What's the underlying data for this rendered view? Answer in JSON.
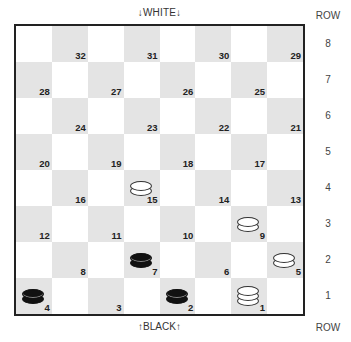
{
  "labels": {
    "top": "↓WHITE↓",
    "bottom": "↑BLACK↑",
    "row_header_top": "ROW",
    "row_header_bottom": "ROW"
  },
  "rows": [
    "8",
    "7",
    "6",
    "5",
    "4",
    "3",
    "2",
    "1"
  ],
  "squares": [
    {
      "num": "32",
      "row": 8,
      "col": 2
    },
    {
      "num": "31",
      "row": 8,
      "col": 4
    },
    {
      "num": "30",
      "row": 8,
      "col": 6
    },
    {
      "num": "29",
      "row": 8,
      "col": 8
    },
    {
      "num": "28",
      "row": 7,
      "col": 1
    },
    {
      "num": "27",
      "row": 7,
      "col": 3
    },
    {
      "num": "26",
      "row": 7,
      "col": 5
    },
    {
      "num": "25",
      "row": 7,
      "col": 7
    },
    {
      "num": "24",
      "row": 6,
      "col": 2
    },
    {
      "num": "23",
      "row": 6,
      "col": 4
    },
    {
      "num": "22",
      "row": 6,
      "col": 6
    },
    {
      "num": "21",
      "row": 6,
      "col": 8
    },
    {
      "num": "20",
      "row": 5,
      "col": 1
    },
    {
      "num": "19",
      "row": 5,
      "col": 3
    },
    {
      "num": "18",
      "row": 5,
      "col": 5
    },
    {
      "num": "17",
      "row": 5,
      "col": 7
    },
    {
      "num": "16",
      "row": 4,
      "col": 2
    },
    {
      "num": "15",
      "row": 4,
      "col": 4
    },
    {
      "num": "14",
      "row": 4,
      "col": 6
    },
    {
      "num": "13",
      "row": 4,
      "col": 8
    },
    {
      "num": "12",
      "row": 3,
      "col": 1
    },
    {
      "num": "11",
      "row": 3,
      "col": 3
    },
    {
      "num": "10",
      "row": 3,
      "col": 5
    },
    {
      "num": "9",
      "row": 3,
      "col": 7
    },
    {
      "num": "8",
      "row": 2,
      "col": 2
    },
    {
      "num": "7",
      "row": 2,
      "col": 4
    },
    {
      "num": "6",
      "row": 2,
      "col": 6
    },
    {
      "num": "5",
      "row": 2,
      "col": 8
    },
    {
      "num": "4",
      "row": 1,
      "col": 1
    },
    {
      "num": "3",
      "row": 1,
      "col": 3
    },
    {
      "num": "2",
      "row": 1,
      "col": 5
    },
    {
      "num": "1",
      "row": 1,
      "col": 7
    }
  ],
  "pieces": [
    {
      "square": "15",
      "color": "white",
      "king": false
    },
    {
      "square": "9",
      "color": "white",
      "king": false
    },
    {
      "square": "5",
      "color": "white",
      "king": false
    },
    {
      "square": "1",
      "color": "white",
      "king": true
    },
    {
      "square": "7",
      "color": "black",
      "king": false
    },
    {
      "square": "4",
      "color": "black",
      "king": false
    },
    {
      "square": "2",
      "color": "black",
      "king": false
    }
  ]
}
